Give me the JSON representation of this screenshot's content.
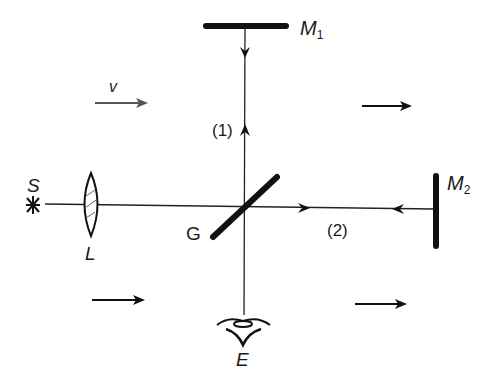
{
  "diagram": {
    "labels": {
      "source": "S",
      "lens": "L",
      "beam_splitter": "G",
      "mirror1": "M",
      "mirror1_sub": "1",
      "mirror2": "M",
      "mirror2_sub": "2",
      "eye": "E",
      "path1": "(1)",
      "path2": "(2)",
      "velocity": "v"
    },
    "colors": {
      "ink": "#111111",
      "velocity_arrow": "#555555"
    }
  }
}
